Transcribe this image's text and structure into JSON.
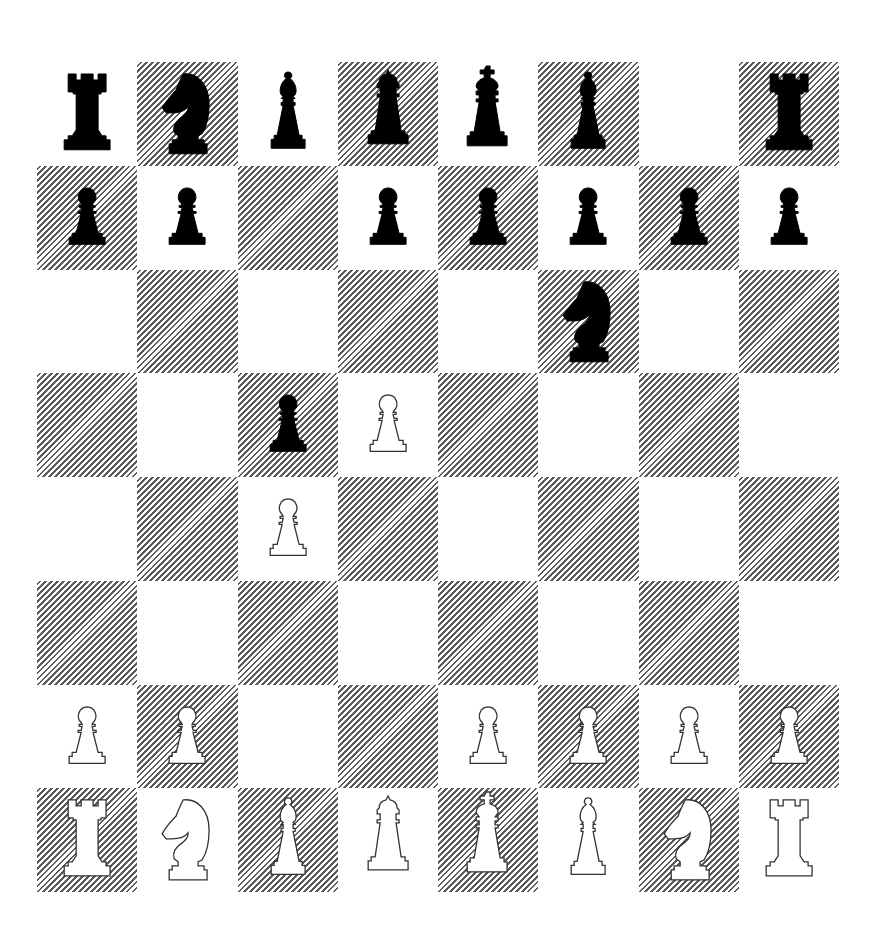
{
  "game": {
    "type": "chess",
    "fen": "rnbqkb1r/pp1ppppp/5n2/2pP4/2P5/8/PP2PPPP/RNBQKBNR",
    "orientation": "white",
    "colors": {
      "light_square": "#ffffff",
      "dark_square_hatch": "#5a5a5a",
      "black_piece": "#000000",
      "white_piece_fill": "#ffffff",
      "white_piece_outline": "#333333"
    }
  },
  "board": {
    "files": [
      "a",
      "b",
      "c",
      "d",
      "e",
      "f",
      "g",
      "h"
    ],
    "ranks": [
      8,
      7,
      6,
      5,
      4,
      3,
      2,
      1
    ],
    "rows": [
      [
        "br",
        "bn",
        "bb",
        "bq",
        "bk",
        "bb",
        "",
        "br"
      ],
      [
        "bp",
        "bp",
        "",
        "bp",
        "bp",
        "bp",
        "bp",
        "bp"
      ],
      [
        "",
        "",
        "",
        "",
        "",
        "bn",
        "",
        ""
      ],
      [
        "",
        "",
        "bp",
        "wp",
        "",
        "",
        "",
        ""
      ],
      [
        "",
        "",
        "wp",
        "",
        "",
        "",
        "",
        ""
      ],
      [
        "",
        "",
        "",
        "",
        "",
        "",
        "",
        ""
      ],
      [
        "wp",
        "wp",
        "",
        "",
        "wp",
        "wp",
        "wp",
        "wp"
      ],
      [
        "wr",
        "wn",
        "wb",
        "wq",
        "wk",
        "wb",
        "wn",
        "wr"
      ]
    ]
  },
  "piece_names": {
    "p": "pawn",
    "n": "knight",
    "b": "bishop",
    "r": "rook",
    "q": "queen",
    "k": "king"
  }
}
